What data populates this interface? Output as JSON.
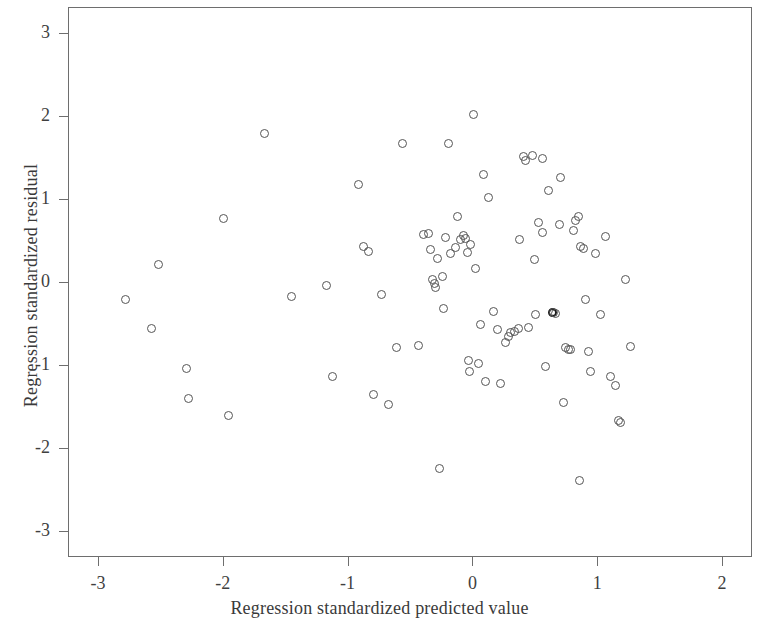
{
  "chart_data": {
    "type": "scatter",
    "title": "",
    "xlabel": "Regression standardized predicted value",
    "ylabel": "Regression standardized residual",
    "xlim": [
      -3.24,
      2.24
    ],
    "ylim": [
      -3.31,
      3.31
    ],
    "xticks": [
      -3,
      -2,
      -1,
      0,
      1,
      2
    ],
    "yticks": [
      3,
      2,
      1,
      0,
      -1,
      -2,
      -3
    ],
    "xtick_labels": [
      "-3",
      "-2",
      "-1",
      "0",
      "1",
      "2"
    ],
    "ytick_labels": [
      "3",
      "2",
      "1",
      "0",
      "-1",
      "-2",
      "-3"
    ],
    "grid": false,
    "legend": null,
    "marker": "open-circle",
    "marker_color": "#555555",
    "n_points": 96,
    "points": [
      [
        -2.79,
        -0.2
      ],
      [
        -2.58,
        -0.55
      ],
      [
        -2.52,
        0.22
      ],
      [
        -2.3,
        -1.03
      ],
      [
        -2.28,
        -1.39
      ],
      [
        -2.0,
        0.78
      ],
      [
        -1.96,
        -1.6
      ],
      [
        -1.67,
        1.8
      ],
      [
        -1.46,
        -0.16
      ],
      [
        -1.18,
        -0.03
      ],
      [
        -1.13,
        -1.12
      ],
      [
        -0.92,
        1.19
      ],
      [
        -0.88,
        0.44
      ],
      [
        -0.84,
        0.38
      ],
      [
        -0.8,
        -1.34
      ],
      [
        -0.74,
        -0.14
      ],
      [
        -0.68,
        -1.46
      ],
      [
        -0.62,
        -0.78
      ],
      [
        -0.57,
        1.68
      ],
      [
        -0.36,
        0.6
      ],
      [
        -0.34,
        0.4
      ],
      [
        -0.33,
        0.04
      ],
      [
        -0.31,
        -0.01
      ],
      [
        -0.3,
        -0.06
      ],
      [
        -0.29,
        0.3
      ],
      [
        -0.27,
        -2.23
      ],
      [
        -0.25,
        0.08
      ],
      [
        -0.24,
        -0.31
      ],
      [
        -0.22,
        0.55
      ],
      [
        -0.2,
        1.68
      ],
      [
        -0.18,
        0.36
      ],
      [
        -0.13,
        0.8
      ],
      [
        -0.1,
        0.52
      ],
      [
        -0.08,
        0.57
      ],
      [
        -0.06,
        0.54
      ],
      [
        -0.05,
        0.37
      ],
      [
        -0.04,
        -0.93
      ],
      [
        -0.03,
        -1.07
      ],
      [
        0.0,
        2.03
      ],
      [
        0.02,
        0.17
      ],
      [
        0.04,
        -0.97
      ],
      [
        0.06,
        -0.5
      ],
      [
        0.08,
        1.3
      ],
      [
        0.1,
        -1.19
      ],
      [
        0.12,
        1.03
      ],
      [
        0.16,
        -0.34
      ],
      [
        0.19,
        -0.56
      ],
      [
        0.22,
        -1.21
      ],
      [
        0.26,
        -0.72
      ],
      [
        0.3,
        -0.6
      ],
      [
        0.33,
        -0.58
      ],
      [
        0.37,
        0.52
      ],
      [
        0.4,
        1.52
      ],
      [
        0.42,
        1.48
      ],
      [
        0.44,
        -0.54
      ],
      [
        0.47,
        1.53
      ],
      [
        0.49,
        0.28
      ],
      [
        0.5,
        -0.38
      ],
      [
        0.52,
        0.73
      ],
      [
        0.55,
        0.61
      ],
      [
        0.58,
        -1.0
      ],
      [
        0.6,
        1.11
      ],
      [
        0.63,
        -0.35
      ],
      [
        0.66,
        -0.37
      ],
      [
        0.69,
        0.71
      ],
      [
        0.7,
        1.27
      ],
      [
        0.72,
        -1.44
      ],
      [
        0.74,
        -0.78
      ],
      [
        0.76,
        -0.8
      ],
      [
        0.78,
        -0.8
      ],
      [
        0.8,
        0.63
      ],
      [
        0.82,
        0.75
      ],
      [
        0.84,
        0.8
      ],
      [
        0.85,
        -2.38
      ],
      [
        0.86,
        0.44
      ],
      [
        0.88,
        0.42
      ],
      [
        0.9,
        -0.2
      ],
      [
        0.94,
        -1.06
      ],
      [
        0.98,
        0.36
      ],
      [
        1.02,
        -0.38
      ],
      [
        1.06,
        0.56
      ],
      [
        1.1,
        -1.12
      ],
      [
        1.14,
        -1.23
      ],
      [
        1.16,
        -1.66
      ],
      [
        1.18,
        -1.68
      ],
      [
        1.22,
        0.04
      ],
      [
        1.26,
        -0.76
      ],
      [
        -0.02,
        0.46
      ],
      [
        -0.14,
        0.43
      ],
      [
        0.28,
        -0.64
      ],
      [
        0.55,
        1.5
      ],
      [
        0.64,
        -0.36
      ],
      [
        0.36,
        -0.55
      ],
      [
        -0.44,
        -0.75
      ],
      [
        0.92,
        -0.82
      ],
      [
        -0.4,
        0.58
      ]
    ],
    "dark_points": [
      [
        0.63,
        -0.35
      ],
      [
        1.17,
        -1.67
      ]
    ]
  },
  "axes": {
    "x_title": "Regression standardized predicted value",
    "y_title": "Regression standardized residual"
  }
}
